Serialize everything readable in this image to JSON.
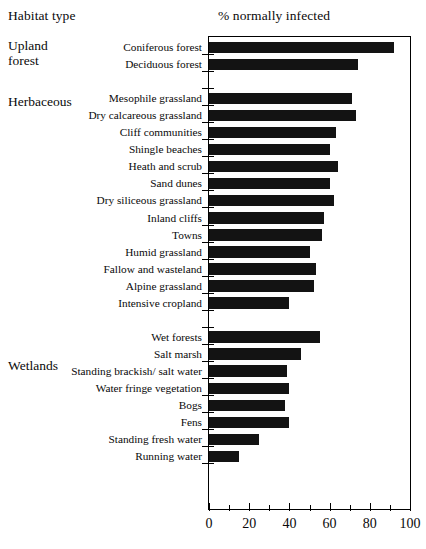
{
  "header": {
    "left_title": "Habitat type",
    "chart_title": "% normally infected"
  },
  "groups": [
    {
      "name": "upland-forest",
      "lines": [
        "Upland",
        "forest"
      ],
      "label": "Upland\nforest"
    },
    {
      "name": "herbaceous",
      "lines": [
        "Herbaceous"
      ],
      "label": "Herbaceous"
    },
    {
      "name": "wetlands",
      "lines": [
        "Wetlands"
      ],
      "label": "Wetlands"
    }
  ],
  "chart_data": {
    "type": "bar",
    "orientation": "horizontal",
    "title": "% normally infected",
    "xlabel": "% normally infected",
    "ylabel": "Habitat type",
    "xlim": [
      0,
      100
    ],
    "xticks": [
      0,
      20,
      40,
      60,
      80,
      100
    ],
    "xtick_labels": [
      "0",
      "20",
      "40",
      "60",
      "80",
      "100"
    ],
    "minor_xticks": [
      10,
      30,
      50,
      70,
      90
    ],
    "grid": false,
    "legend": null,
    "bar_color": "#131313",
    "categories": [
      "Coniferous forest",
      "Deciduous forest",
      "Mesophile grassland",
      "Dry calcareous grassland",
      "Cliff communities",
      "Shingle beaches",
      "Heath and scrub",
      "Sand dunes",
      "Dry siliceous grassland",
      "Inland cliffs",
      "Towns",
      "Humid grassland",
      "Fallow and wasteland",
      "Alpine grassland",
      "Intensive cropland",
      "Wet forests",
      "Salt marsh",
      "Standing brackish/ salt water",
      "Water fringe vegetation",
      "Bogs",
      "Fens",
      "Standing fresh water",
      "Running water"
    ],
    "values": [
      92,
      74,
      71,
      73,
      63,
      60,
      64,
      60,
      62,
      57,
      56,
      50,
      53,
      52,
      40,
      55,
      46,
      39,
      40,
      38,
      40,
      25,
      15
    ],
    "groups": [
      {
        "label": "Upland forest",
        "categories": [
          "Coniferous forest",
          "Deciduous forest"
        ]
      },
      {
        "label": "Herbaceous",
        "categories": [
          "Mesophile grassland",
          "Dry calcareous grassland",
          "Cliff communities",
          "Shingle beaches",
          "Heath and scrub",
          "Sand dunes",
          "Dry siliceous grassland",
          "Inland cliffs",
          "Towns",
          "Humid grassland",
          "Fallow and wasteland",
          "Alpine grassland",
          "Intensive cropland"
        ]
      },
      {
        "label": "Wetlands",
        "categories": [
          "Wet forests",
          "Salt marsh",
          "Standing brackish/ salt water",
          "Water fringe vegetation",
          "Bogs",
          "Fens",
          "Standing fresh water",
          "Running water"
        ]
      }
    ]
  }
}
